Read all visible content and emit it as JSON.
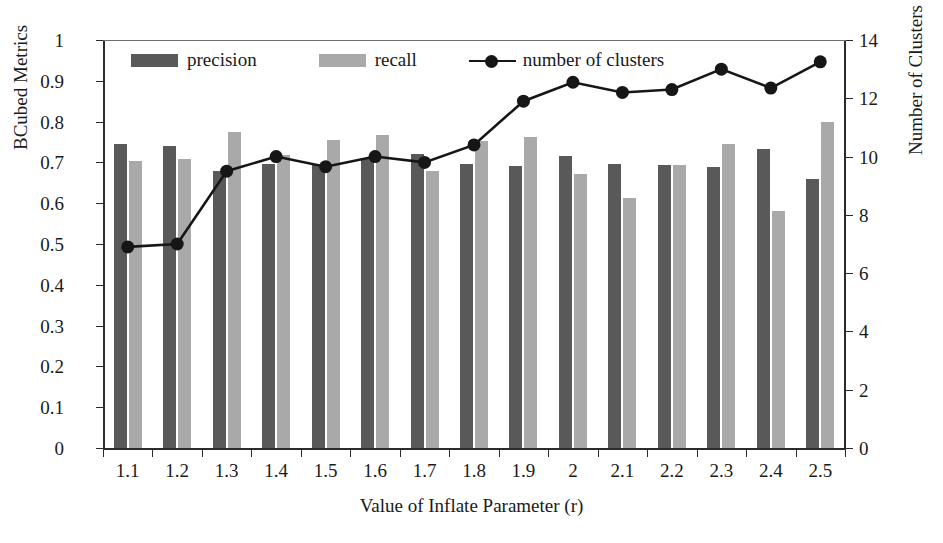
{
  "chart_data": {
    "type": "bar",
    "title": "",
    "xlabel": "Value of Inflate Parameter (r)",
    "ylabel": "BCubed Metrics",
    "y2label": "Number of Clusters",
    "categories": [
      "1.1",
      "1.2",
      "1.3",
      "1.4",
      "1.5",
      "1.6",
      "1.7",
      "1.8",
      "1.9",
      "2",
      "2.1",
      "2.2",
      "2.3",
      "2.4",
      "2.5"
    ],
    "ylim": [
      0,
      1
    ],
    "y2lim": [
      0,
      14
    ],
    "yticks": [
      "0",
      "0.1",
      "0.2",
      "0.3",
      "0.4",
      "0.5",
      "0.6",
      "0.7",
      "0.8",
      "0.9",
      "1"
    ],
    "y2ticks": [
      "0",
      "2",
      "4",
      "6",
      "8",
      "10",
      "12",
      "14"
    ],
    "grid": false,
    "legend_position": "top-left-inside",
    "series": [
      {
        "name": "precision",
        "kind": "bar",
        "axis": "left",
        "color": "#595959",
        "values": [
          0.745,
          0.74,
          0.68,
          0.695,
          0.695,
          0.71,
          0.72,
          0.695,
          0.69,
          0.715,
          0.697,
          0.693,
          0.688,
          0.733,
          0.66
        ]
      },
      {
        "name": "recall",
        "kind": "bar",
        "axis": "left",
        "color": "#a9a9a9",
        "values": [
          0.703,
          0.708,
          0.775,
          0.718,
          0.755,
          0.768,
          0.678,
          0.752,
          0.762,
          0.672,
          0.612,
          0.693,
          0.745,
          0.582,
          0.8
        ]
      },
      {
        "name": "number of clusters",
        "kind": "line",
        "axis": "right",
        "color": "#161616",
        "marker": "filled-circle",
        "values": [
          6.9,
          7.0,
          9.5,
          10.0,
          9.65,
          10.0,
          9.8,
          10.4,
          11.9,
          12.55,
          12.2,
          12.3,
          13.0,
          12.35,
          13.25
        ]
      }
    ]
  },
  "legend": {
    "precision_label": "precision",
    "recall_label": "recall",
    "clusters_label": "number of clusters"
  },
  "colors": {
    "precision": "#595959",
    "recall": "#a9a9a9",
    "line": "#161616",
    "axis": "#2b2b2b",
    "background": "#ffffff"
  }
}
